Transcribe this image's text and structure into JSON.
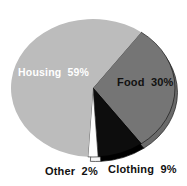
{
  "chart_data": {
    "type": "pie",
    "title": "",
    "legend": "none",
    "direction": "clockwise",
    "start_angle_deg": 36,
    "background_color": "#ffffff",
    "slices": [
      {
        "label": "Food",
        "pct": 30,
        "display": "Food 30%",
        "color": "#757575",
        "side_color": "#6a6a6a",
        "stroke": "#1a1a1a",
        "text_color": "#111111",
        "depth": true
      },
      {
        "label": "Clothing",
        "pct": 9,
        "display": "Clothing 9%",
        "color": "#0d0d0d",
        "side_color": "#000000",
        "stroke": "#000000",
        "text_color": "#111111",
        "depth": true
      },
      {
        "label": "Other",
        "pct": 2,
        "display": "Other 2%",
        "color": "#fcfcfc",
        "side_color": "#f5f5f5",
        "stroke": "#2e2e2e",
        "text_color": "#111111",
        "depth": true
      },
      {
        "label": "Housing",
        "pct": 59,
        "display": "Housing 59%",
        "color": "#bcbcbc",
        "side_color": "#bcbcbc",
        "stroke": "",
        "text_color": "#ffffff",
        "depth": false
      }
    ]
  }
}
